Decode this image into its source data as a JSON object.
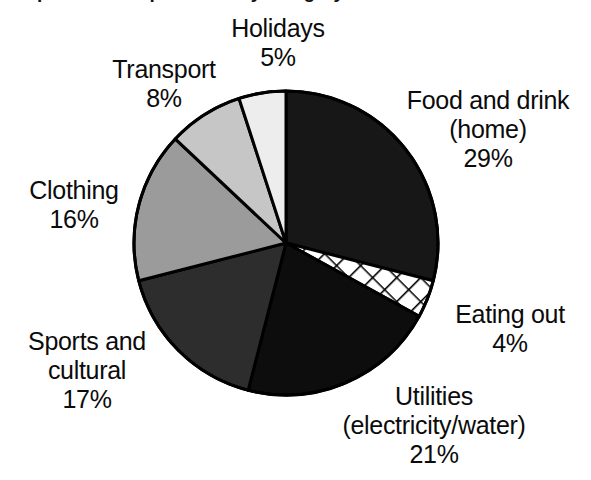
{
  "chart_data": {
    "type": "pie",
    "title": "Proportion of expenditure by category - 2003",
    "xlabel": "",
    "ylabel": "",
    "legend_position": "none",
    "grid": false,
    "units": "percent",
    "categories": [
      "Food and drink (home)",
      "Eating out",
      "Utilities (electricity/water)",
      "Sports and cultural",
      "Clothing",
      "Transport",
      "Holidays"
    ],
    "values": [
      29,
      4,
      21,
      17,
      16,
      8,
      5
    ],
    "slices": [
      {
        "id": "food",
        "name": "Food and drink (home)",
        "label_line1": "Food and drink",
        "label_line2": "(home)",
        "value": 29,
        "value_label": "29%",
        "fill": "#171717",
        "pattern": "solid",
        "start_angle": 0,
        "end_angle": 104.4
      },
      {
        "id": "eating-out",
        "name": "Eating out",
        "label_line1": "Eating out",
        "label_line2": "",
        "value": 4,
        "value_label": "4%",
        "fill": "#ffffff",
        "pattern": "crosshatch",
        "start_angle": 104.4,
        "end_angle": 118.8
      },
      {
        "id": "utilities",
        "name": "Utilities (electricity/water)",
        "label_line1": "Utilities",
        "label_line2": "(electricity/water)",
        "value": 21,
        "value_label": "21%",
        "fill": "#0d0d0d",
        "pattern": "solid",
        "start_angle": 118.8,
        "end_angle": 194.4
      },
      {
        "id": "sports",
        "name": "Sports and cultural",
        "label_line1": "Sports and",
        "label_line2": "cultural",
        "value": 17,
        "value_label": "17%",
        "fill": "#2d2d2d",
        "pattern": "solid",
        "start_angle": 194.4,
        "end_angle": 255.6
      },
      {
        "id": "clothing",
        "name": "Clothing",
        "label_line1": "Clothing",
        "label_line2": "",
        "value": 16,
        "value_label": "16%",
        "fill": "#9b9b9b",
        "pattern": "solid",
        "start_angle": 255.6,
        "end_angle": 313.2
      },
      {
        "id": "transport",
        "name": "Transport",
        "label_line1": "Transport",
        "label_line2": "",
        "value": 8,
        "value_label": "8%",
        "fill": "#c6c6c6",
        "pattern": "solid",
        "start_angle": 313.2,
        "end_angle": 342.0
      },
      {
        "id": "holidays",
        "name": "Holidays",
        "label_line1": "Holidays",
        "label_line2": "",
        "value": 5,
        "value_label": "5%",
        "fill": "#ededed",
        "pattern": "solid",
        "start_angle": 342.0,
        "end_angle": 360.0
      }
    ],
    "style": {
      "outline_color": "#000000",
      "outline_width": 3,
      "background": "#ffffff",
      "text_color": "#0b0b0b",
      "center_x": 286,
      "center_y": 243,
      "radius": 152
    }
  },
  "labels": {
    "holidays": {
      "line1": "Holidays",
      "pct": "5%"
    },
    "transport": {
      "line1": "Transport",
      "pct": "8%"
    },
    "clothing": {
      "line1": "Clothing",
      "pct": "16%"
    },
    "sports": {
      "line1": "Sports and",
      "line2": "cultural",
      "pct": "17%"
    },
    "food": {
      "line1": "Food and drink",
      "line2": "(home)",
      "pct": "29%"
    },
    "eating": {
      "line1": "Eating out",
      "pct": "4%"
    },
    "utilities": {
      "line1": "Utilities",
      "line2": "(electricity/water)",
      "pct": "21%"
    }
  }
}
